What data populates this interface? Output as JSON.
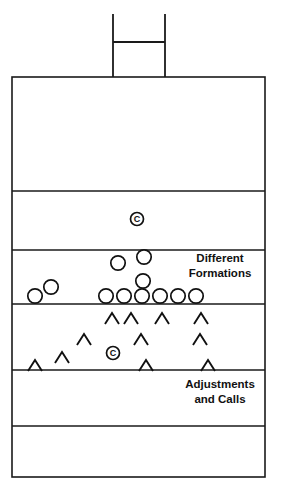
{
  "diagram": {
    "type": "football-play-diagram",
    "background_color": "#ffffff",
    "line_color": "#1a1a1a",
    "marker_color": "#111111",
    "field": {
      "left": 12,
      "right": 265,
      "top": 77,
      "bottom": 477,
      "border_width": 1.6,
      "yard_line_width": 1.5,
      "yard_lines_y": [
        191,
        250,
        304,
        370,
        426
      ],
      "zones": [
        {
          "name": "end-zone-top",
          "top": 77,
          "bottom": 191
        },
        {
          "name": "zone-second",
          "top": 191,
          "bottom": 250
        },
        {
          "name": "offense-formation-zone",
          "top": 250,
          "bottom": 304
        },
        {
          "name": "defense-adjustment-zone",
          "top": 304,
          "bottom": 370
        },
        {
          "name": "zone-fifth",
          "top": 370,
          "bottom": 426
        },
        {
          "name": "end-zone-bottom",
          "top": 426,
          "bottom": 477
        }
      ]
    },
    "goalpost": {
      "name": "goalpost",
      "left_upright_x": 113,
      "right_upright_x": 165,
      "top_y": 14,
      "base_y": 77,
      "crossbar_y": 42,
      "stroke_width": 1.8
    },
    "annotations": [
      {
        "name": "different-formations-label",
        "lines": [
          "Different",
          "Formations"
        ],
        "x": 220,
        "y": 262,
        "line_height": 15
      },
      {
        "name": "adjustments-and-calls-label",
        "lines": [
          "Adjustments",
          "and Calls"
        ],
        "x": 220,
        "y": 388,
        "line_height": 15
      }
    ],
    "center_markers": [
      {
        "name": "center-marker-quarterback",
        "label": "C",
        "cx": 137,
        "cy": 219,
        "r": 6.5
      },
      {
        "name": "center-marker-defense",
        "label": "C",
        "cx": 113,
        "cy": 353,
        "r": 6.5
      }
    ],
    "offense_circles": {
      "radius": 7.2,
      "description": "Offensive players shown as open circles",
      "positions": [
        {
          "cx": 35,
          "cy": 296
        },
        {
          "cx": 51,
          "cy": 287
        },
        {
          "cx": 106,
          "cy": 296
        },
        {
          "cx": 124,
          "cy": 296
        },
        {
          "cx": 142,
          "cy": 296
        },
        {
          "cx": 160,
          "cy": 296
        },
        {
          "cx": 178,
          "cy": 296
        },
        {
          "cx": 196,
          "cy": 296
        },
        {
          "cx": 143,
          "cy": 281
        },
        {
          "cx": 118,
          "cy": 263
        },
        {
          "cx": 144,
          "cy": 257
        }
      ]
    },
    "defense_chevrons": {
      "half_width": 7,
      "height": 11,
      "description": "Defensive players shown as open chevrons (carets)",
      "positions": [
        {
          "cx": 112,
          "cy": 324
        },
        {
          "cx": 131,
          "cy": 324
        },
        {
          "cx": 162,
          "cy": 324
        },
        {
          "cx": 201,
          "cy": 324
        },
        {
          "cx": 84,
          "cy": 345
        },
        {
          "cx": 141,
          "cy": 345
        },
        {
          "cx": 200,
          "cy": 345
        },
        {
          "cx": 62,
          "cy": 363
        },
        {
          "cx": 35,
          "cy": 371
        },
        {
          "cx": 146,
          "cy": 371
        },
        {
          "cx": 208,
          "cy": 371
        }
      ]
    }
  }
}
